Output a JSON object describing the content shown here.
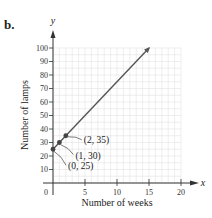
{
  "figure": {
    "part_label": "b."
  },
  "chart_data": {
    "type": "line",
    "title": "",
    "xlabel": "Number of weeks",
    "ylabel": "Number of lamps",
    "x_axis_var": "x",
    "y_axis_var": "y",
    "xlim": [
      0,
      20
    ],
    "ylim": [
      0,
      100
    ],
    "x_ticks": [
      0,
      5,
      10,
      15,
      20
    ],
    "y_ticks": [
      10,
      20,
      30,
      40,
      50,
      60,
      70,
      80,
      90,
      100
    ],
    "x_tick_labels": [
      "0",
      "5",
      "10",
      "15",
      "20"
    ],
    "y_tick_labels": [
      "10",
      "20",
      "30",
      "40",
      "50",
      "60",
      "70",
      "80",
      "90",
      "100"
    ],
    "grid": true,
    "legend": null,
    "series": [
      {
        "name": "lamps",
        "equation": "y = 5x + 25",
        "x": [
          0,
          15
        ],
        "values": [
          25,
          100
        ],
        "color": "#555555"
      }
    ],
    "points": [
      {
        "x": 0,
        "y": 25,
        "label": "(0, 25)"
      },
      {
        "x": 1,
        "y": 30,
        "label": "(1, 30)"
      },
      {
        "x": 2,
        "y": 35,
        "label": "(2, 35)"
      }
    ]
  }
}
